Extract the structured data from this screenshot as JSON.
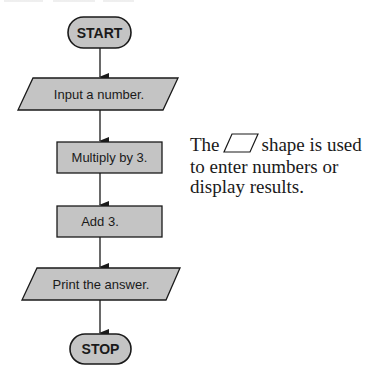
{
  "diagram": {
    "type": "flowchart",
    "colors": {
      "fill": "#c4c4c4",
      "stroke": "#1a1a1a",
      "text": "#1a1a1a",
      "background": "#ffffff"
    },
    "nodes": [
      {
        "id": "start",
        "shape": "terminal",
        "label": "START"
      },
      {
        "id": "input",
        "shape": "parallelogram",
        "label": "Input a number."
      },
      {
        "id": "multiply",
        "shape": "rectangle",
        "label": "Multiply by 3."
      },
      {
        "id": "add",
        "shape": "rectangle",
        "label": "Add 3."
      },
      {
        "id": "print",
        "shape": "parallelogram",
        "label": "Print the answer."
      },
      {
        "id": "stop",
        "shape": "terminal",
        "label": "STOP"
      }
    ],
    "edges": [
      {
        "from": "start",
        "to": "input"
      },
      {
        "from": "input",
        "to": "multiply"
      },
      {
        "from": "multiply",
        "to": "add"
      },
      {
        "from": "add",
        "to": "print"
      },
      {
        "from": "print",
        "to": "stop"
      }
    ]
  },
  "annotation": {
    "line1_before": "The",
    "inline_shape": "parallelogram-icon",
    "line1_after": "shape is used",
    "line2": "to enter numbers or",
    "line3": "display results."
  }
}
